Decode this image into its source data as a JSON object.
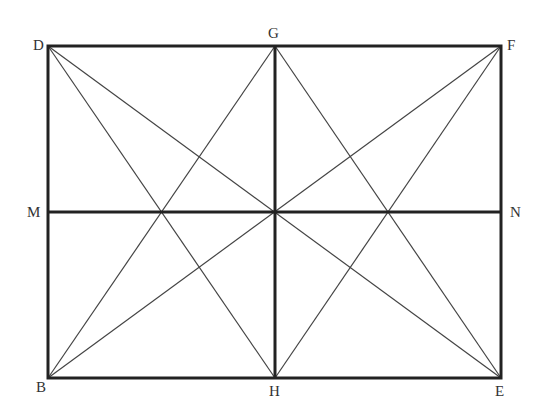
{
  "diagram": {
    "type": "geometric-figure",
    "points": {
      "D": {
        "x": 48,
        "y": 46,
        "label": "D"
      },
      "G": {
        "x": 275,
        "y": 46,
        "label": "G"
      },
      "F": {
        "x": 501,
        "y": 46,
        "label": "F"
      },
      "M": {
        "x": 48,
        "y": 212,
        "label": "M"
      },
      "N": {
        "x": 501,
        "y": 212,
        "label": "N"
      },
      "B": {
        "x": 48,
        "y": 378,
        "label": "B"
      },
      "H": {
        "x": 275,
        "y": 378,
        "label": "H"
      },
      "E": {
        "x": 501,
        "y": 378,
        "label": "E"
      }
    },
    "thick_segments": [
      "DF",
      "FE",
      "EB",
      "BD",
      "GH",
      "MN"
    ],
    "thin_segments": [
      "DE",
      "FB",
      "DH",
      "GB",
      "GE",
      "FH"
    ],
    "colors": {
      "thick": "#222222",
      "thin": "#444444",
      "label": "#333333"
    }
  }
}
